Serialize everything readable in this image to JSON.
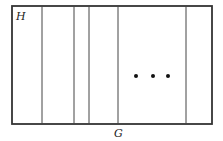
{
  "diagram": {
    "region_label": "H",
    "base_label": "G",
    "ellipsis": "• • •",
    "stroke_color": "#333333",
    "outer_rect": {
      "x": 12,
      "y": 6,
      "width": 200,
      "height": 118
    },
    "vertical_lines_x": [
      42,
      74,
      89,
      118,
      186
    ],
    "dots": [
      {
        "x": 136,
        "y": 76
      },
      {
        "x": 153,
        "y": 76
      },
      {
        "x": 168,
        "y": 76
      }
    ]
  }
}
